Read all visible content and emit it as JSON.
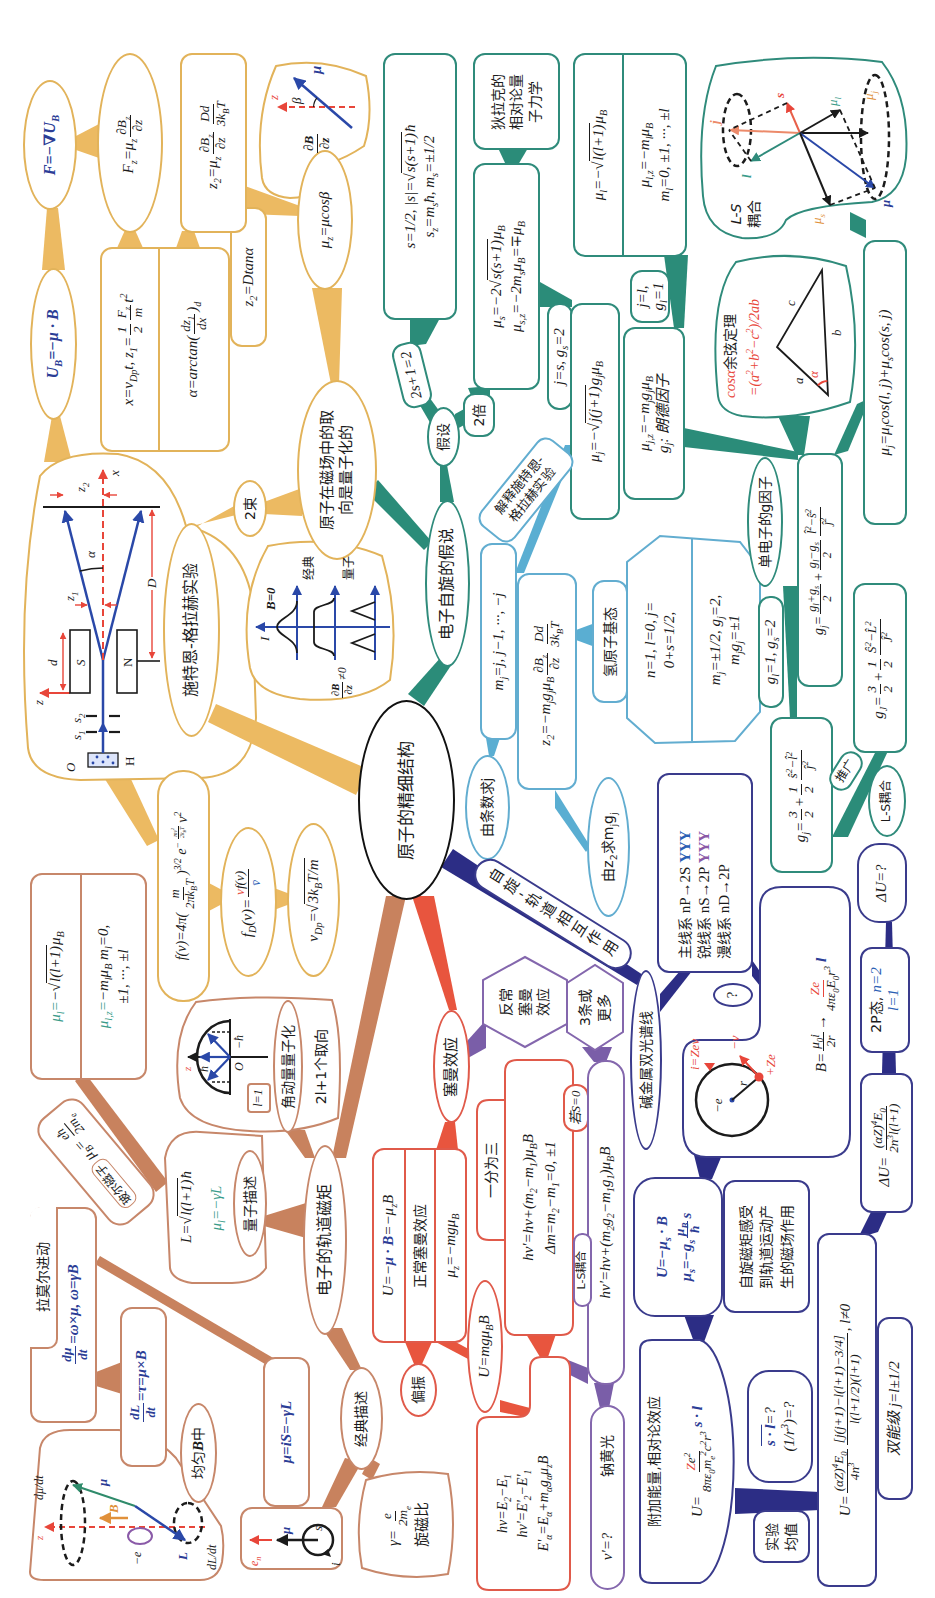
{
  "central": {
    "title": "原子的精细结构"
  },
  "colors": {
    "stern_gerlach_fill": "#ecba62",
    "spin_fill": "#2b8c79",
    "measure_fill": "#5aaed2",
    "spin_orbit_fill": "#2c2d85",
    "zeeman_fill": "#e8553e",
    "anomalous_fill": "#7a5ea8",
    "orbital_fill": "#c8825e",
    "vector_blue": "#2b3d96",
    "accent_red": "#e8463a"
  },
  "sg": {
    "experiment": "施特恩-格拉赫实验",
    "force_grad": "F=−∇U_{B}",
    "potential": "U_{B}=−μ · B",
    "fz": {
      "lhs": "F_{z}=μ_{z}",
      "num": "∂B_{z}",
      "den": "∂z"
    },
    "motion": {
      "x_prefix": "x=v_{Dp}t, z_{1}=",
      "half_num": "1",
      "half_den": "2",
      "f_num": "F_{z}",
      "f_den": "m",
      "x_suffix": "t^{2}",
      "alpha_prefix": "α=arctan(",
      "alpha_num": "dz_{1}",
      "alpha_den": "dx",
      "alpha_suffix": ")_{d}"
    },
    "z2": {
      "lhs": "z_{2}=μ_{z}",
      "num1": "∂B_{z}",
      "den1": "∂z",
      "num2": "Dd",
      "den2": "3k_{B}T"
    },
    "z2_tan": "z_{2}=Dtanα",
    "beta_diagram": {
      "grad_num": "∂B",
      "grad_den": "∂z",
      "z": "z",
      "beta": "β",
      "mu": "μ"
    },
    "mu_z": "μ_{z}=μcosβ",
    "orientation": [
      "原子在磁场中的取",
      "向是量子化的"
    ],
    "two_beams": "2束",
    "apparatus": {
      "O": "O",
      "H": "H",
      "s1": "s_{1}",
      "s2": "s_{2}",
      "z": "z",
      "d": "d",
      "S": "S",
      "N": "N",
      "z1": "z_{1}",
      "z2": "z_{2}",
      "alpha": "α",
      "x": "x",
      "D": "D"
    },
    "distribution_graph": {
      "I": "I",
      "b_zero": "B=0",
      "classical": "经典",
      "quantum": "量子",
      "grad_num": "∂B",
      "grad_den": "∂z",
      "grad_suffix": "≠0"
    },
    "maxwell": {
      "prefix": "f(v)=4π(",
      "num": "m",
      "den": "2πk_{B}T",
      "power": ")^{3/2}",
      "e": " e",
      "exp_sign": "−",
      "exp_num": "mv^{2}",
      "exp_den": "2k_{B}T",
      "tail": "v^{2}"
    },
    "beam_distribution": {
      "lhs": "f_{D}(v)=",
      "num_red": "v",
      "num": "f(v)",
      "den": "v̄"
    },
    "most_probable_speed": {
      "lhs": "v_{Dp}=√",
      "rad": "3k_{B}T/m"
    }
  },
  "spin": {
    "hypothesis": "电子自旋的假说",
    "assume": "假设",
    "multiplicity": "2s+1=2",
    "double": "2倍",
    "s_box": {
      "l1_prefix": "s=1/2, |s|=√",
      "l1_rad": "s(s+1)",
      "l1_suffix": "ħ",
      "l2": "s_{z}=m_{s}ħ, m_{s}=±1/2"
    },
    "mu_s": {
      "l1_prefix": "μ_{s}=−2√",
      "l1_rad": "s(s+1)",
      "l1_suffix": "μ_{B}",
      "l2": "μ_{s,z}=−2m_{s}μ_{B}=∓μ_{B}"
    },
    "dirac": [
      "狄拉克的",
      "相对论量",
      "子力学"
    ],
    "mu_l": {
      "l1_prefix": "μ_{l}=−√",
      "l1_rad": "l(l+1)",
      "l1_suffix": "μ_{B}",
      "l2": "μ_{l,z}=−m_{l}μ_{B}",
      "l3": "m_{l}=0, ±1, ···, ±l"
    },
    "j_s": "j=s, g_{s}=2",
    "j_l": [
      "j=l,",
      "g_{l}=1"
    ],
    "mu_j": {
      "prefix": "μ_{j}=−√",
      "rad": "j(j+1)",
      "suffix": "g_{j}μ_{B}"
    },
    "mu_jz": {
      "l1": "μ_{j,z}=−m_{j}g_{j}μ_{B}",
      "l2": "g_{j}: 朗德因子"
    },
    "ls_diagram": {
      "label": [
        "L-S",
        "耦合"
      ],
      "s": "s",
      "j": "j",
      "l": "l",
      "mu_l": "μ_{l}",
      "mu_j": "μ_{j}",
      "mu": "μ",
      "mu_s": "μ_{s}"
    },
    "cosine": {
      "title_red": "cosα",
      "title": "余弦定理",
      "formula": "=(a^{2}+b^{2}−c^{2})/2ab",
      "a": "a",
      "b": "b",
      "c": "c",
      "alpha": "α"
    },
    "mu_j_cos": "μ_{j}=μ_{l}cos(l, j)+μ_{s}cos(s, j)",
    "single_g": "单电子的g因子",
    "g_general": {
      "lhs": "g_{j}=",
      "n1": "g_{l}+g_{s}",
      "d1": "2",
      "plus": "+",
      "n2": "g_{l}−g_{s}",
      "d2": "2",
      "n3": "l̂^{2}−ŝ^{2}",
      "d3": "ĵ^{2}"
    },
    "g_values": "g_{l}=1, g_{s}=2",
    "g_ls": {
      "lhs": "g_{j}=",
      "n1": "3",
      "d1": "2",
      "plus": "+",
      "n2": "1",
      "d2": "2",
      "n3": "ŝ^{2}−l̂^{2}",
      "d3": "ĵ^{2}"
    },
    "g_LS": {
      "lhs": "g_{J}=",
      "n1": "3",
      "d1": "2",
      "plus": "+",
      "n2": "1",
      "d2": "2",
      "n3": "Ŝ^{2}−L̂^{2}",
      "d3": "Ĵ^{2}"
    },
    "generalize": "推广",
    "ls_coupling": "L-S耦合",
    "explain": [
      "解释施特恩-",
      "格拉赫实验"
    ]
  },
  "measure": {
    "mj_values": "m_{j}=j, j−1, ···, −j",
    "z2": {
      "lhs": "z_{2}=−m_{j}g_{j}μ_{B}",
      "num1": "∂B_{z}",
      "den1": "∂z",
      "num2": "Dd",
      "den2": "3k_{B}T"
    },
    "hydrogen": "氢原子基态",
    "h_state": {
      "r1l1": "n=1, l=0, j=",
      "r1l2": "0+s=1/2,",
      "r2l1": "m_{j}=±1/2, g_{j}=2,",
      "r2l2": "m_{j}g_{j}=±1"
    },
    "from_count": "由条数求j",
    "from_z2": "由z_{2}求m_{j}g_{j}"
  },
  "spin_orbit": {
    "label": "自旋-轨道相互作用",
    "alkali": "碱金属双光谱线",
    "series": [
      {
        "name": "主线系",
        "transition": "nP→2S",
        "lines": "ΥΥΥ"
      },
      {
        "name": "锐线系",
        "transition": "nS→2P",
        "lines": "ΥΥΥ"
      },
      {
        "name": "漫线系",
        "transition": "nD→2P",
        "lines": ""
      }
    ],
    "question": "?",
    "circle": {
      "minus_e": "−e",
      "r": "r",
      "plus_ze": "+Ze",
      "minus_v": "−v",
      "current": "i=Zev"
    },
    "b_field": {
      "prefix": "B=",
      "n1": "μ_{0}i",
      "d1": "2r",
      "arrow": "→",
      "n2": "Ze",
      "d2": "4πε_{0}E_{0}r^{3}",
      "suffix": "l"
    },
    "delta_u_question": "ΔU=?",
    "state_2p": {
      "prefix": "2P态, ",
      "n": "n=2",
      "l": "l=1"
    },
    "delta_u": {
      "lhs": "ΔU=",
      "num": "(αZ)^{4}E_{0}",
      "den": "2n^{3}l(l+1)"
    },
    "u_spin": {
      "l1": "U=−μ_{s} · B",
      "l2_prefix": "μ_{s}=−g_{s}",
      "num": "μ_{B}",
      "den": "ħ",
      "l2_suffix": "s"
    },
    "feel": [
      "自旋磁矩感受",
      "到轨道运动产",
      "生的磁场作用"
    ],
    "extra": {
      "title": "附加能量,相对论效应",
      "lhs": "U=",
      "num_red": "Z",
      "num": "e^{2}",
      "den": "8πε_{0}m_{e}^{2}c^{2}r^{3}",
      "suffix": "s · l"
    },
    "averages": {
      "sl": "s · l",
      "sl_q": "=?",
      "r3": "(1/r^{3})=?"
    },
    "experiment_average": [
      "实验",
      "均值"
    ],
    "u_fine": {
      "lhs": "U=",
      "n1": "(αZ)^{4}E_{0}",
      "d1": "4n^{3}",
      "n2": "[j(j+1)−l(l+1)−3/4]",
      "d2": "l(l+1/2)(l+1)",
      "suffix": ", l≠0"
    },
    "double_level": "双能级 j=l±1/2"
  },
  "zeeman": {
    "title": "塞曼效应",
    "normal": {
      "r1_a": "U=−",
      "r1_b": "μ · B",
      "r1_c": "=−μ_{z}B",
      "r2": "正常塞曼效应",
      "r3": "μ_{z}=−mgμ_{B}"
    },
    "polarization": "偏振",
    "u_mg": "U=mgμ_{B}B",
    "levels": [
      "hν=E_{2}−E_{1}",
      "hν'=E'_{2}−E'_{1}",
      "E'_{α}=E_{α}+m_{α}g_{α}μ_{z}B"
    ],
    "split": {
      "tab": "一分为三",
      "l1": "hν'=hν+(m_{2}−m_{1})μ_{B}B",
      "l2": "Δm=m_{2}−m_{1}=0, ±1"
    },
    "if_s0": "若S=0"
  },
  "anomalous": {
    "title": [
      "反常",
      "塞曼",
      "效应"
    ],
    "lines": [
      "3条或",
      "更多"
    ],
    "ls_tab": "L-S耦合",
    "formula": "hν'=hν+(m_{2}g_{2}−m_{1}g_{1})μ_{B}B",
    "sodium": {
      "q": "ν'=?",
      "name": "钠黄光"
    }
  },
  "orbital": {
    "title": "电子的轨道磁矩",
    "ang_quant": "角动量量子化",
    "orientations": "2l+1个取向",
    "l_one": "l=1",
    "hemisphere": {
      "z": "z",
      "hbar": "ħ",
      "origin": "O",
      "neg_hbar": "−ħ"
    },
    "mu_l": {
      "lhs": "μ_{l}=",
      "rest": "−√",
      "rad": "l(l+1)",
      "suffix": "μ_{B}",
      "l2_lhs": "μ_{l,z}=",
      "l2_rest": "−m_{l}μ_{B} m_{l}=0,",
      "l3": "±1, ···, ±l"
    },
    "bohr": {
      "name": "玻尔磁子",
      "lhs": "μ_{B}=",
      "num": "eħ",
      "den": "2m_{e}"
    },
    "quantum_L": {
      "prefix": "L=√",
      "rad": "l(l+1)",
      "suffix": "ħ",
      "mu": "μ_{l}=−γL"
    },
    "quantum_desc": "量子描述",
    "larmor": {
      "title": "拉莫尔进动",
      "num": "dμ",
      "den": "dt",
      "rhs": "=ω×μ, ω=γB"
    },
    "torque": {
      "num": "dL",
      "den": "dt",
      "rhs": "=τ=μ×B"
    },
    "uniform": {
      "pre": "均匀",
      "B": "B",
      "post": "中"
    },
    "precession": {
      "z": "z",
      "B": "B",
      "mu": "μ",
      "L": "L",
      "minus_e": "−e",
      "dmu": "dμ/dt",
      "dL": "dL/dt"
    },
    "mu_is": "μ=iS=−γL",
    "classical": "经典描述",
    "loop": {
      "en": "e_{n}",
      "mu": "μ",
      "s": "s",
      "i": "i"
    },
    "gyro": {
      "lhs": "γ=",
      "num": "e",
      "den": "2m_{e}",
      "name": "旋磁比"
    }
  }
}
